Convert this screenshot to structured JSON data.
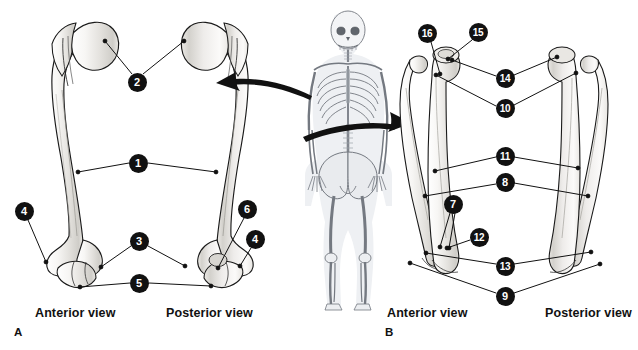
{
  "figure": {
    "background_color": "#ffffff",
    "callout_color": "#111111",
    "callout_text_color": "#ffffff",
    "leader_line_color": "#111111",
    "bone_fill": "#f2f1ef",
    "bone_outline": "#1a1a1a",
    "skeleton_tint": "#c9cdd4"
  },
  "panels": [
    {
      "id": "A",
      "letter": "A",
      "letter_pos": {
        "x": 14,
        "y": 326
      },
      "subject": "humerus",
      "views": [
        {
          "label": "Anterior view",
          "x": 35,
          "y": 306
        },
        {
          "label": "Posterior view",
          "x": 166,
          "y": 306
        }
      ]
    },
    {
      "id": "B",
      "letter": "B",
      "letter_pos": {
        "x": 385,
        "y": 326
      },
      "subject": "radius-and-ulna",
      "views": [
        {
          "label": "Anterior view",
          "x": 387,
          "y": 306
        },
        {
          "label": "Posterior view",
          "x": 545,
          "y": 306
        }
      ]
    }
  ],
  "callouts": [
    {
      "n": "1",
      "panel": "A",
      "cx": 138,
      "cy": 163,
      "leaders": [
        [
          129,
          163,
          78,
          172
        ],
        [
          148,
          163,
          216,
          172
        ]
      ]
    },
    {
      "n": "2",
      "panel": "A",
      "cx": 137,
      "cy": 82,
      "leaders": [
        [
          132,
          74,
          105,
          41
        ],
        [
          143,
          74,
          184,
          41
        ]
      ]
    },
    {
      "n": "3",
      "panel": "A",
      "cx": 139,
      "cy": 241,
      "leaders": [
        [
          131,
          246,
          101,
          267
        ],
        [
          148,
          246,
          185,
          266
        ]
      ]
    },
    {
      "n": "4",
      "panel": "A",
      "cx": 24,
      "cy": 211,
      "leaders": [
        [
          28,
          220,
          46,
          262
        ]
      ]
    },
    {
      "n": "5",
      "panel": "A",
      "cx": 139,
      "cy": 283,
      "leaders": [
        [
          130,
          283,
          80,
          287
        ],
        [
          149,
          283,
          211,
          286
        ]
      ]
    },
    {
      "n": "6",
      "panel": "A",
      "cx": 247,
      "cy": 209,
      "leaders": [
        [
          244,
          218,
          218,
          268
        ]
      ]
    },
    {
      "n": "4",
      "panel": "A",
      "cx": 255,
      "cy": 239,
      "leaders": [
        [
          251,
          248,
          240,
          266
        ]
      ]
    },
    {
      "n": "7",
      "panel": "B",
      "cx": 453,
      "cy": 204,
      "leaders": [
        [
          450,
          213,
          440,
          247
        ],
        [
          455,
          213,
          449,
          248
        ]
      ]
    },
    {
      "n": "8",
      "panel": "B",
      "cx": 505,
      "cy": 182,
      "leaders": [
        [
          496,
          184,
          425,
          196
        ],
        [
          514,
          183,
          588,
          196
        ]
      ]
    },
    {
      "n": "9",
      "panel": "B",
      "cx": 505,
      "cy": 296,
      "leaders": [
        [
          496,
          293,
          410,
          263
        ],
        [
          514,
          293,
          600,
          264
        ]
      ]
    },
    {
      "n": "10",
      "panel": "B",
      "cx": 505,
      "cy": 108,
      "leaders": [
        [
          496,
          106,
          436,
          75
        ],
        [
          514,
          105,
          576,
          73
        ]
      ]
    },
    {
      "n": "11",
      "panel": "B",
      "cx": 505,
      "cy": 156,
      "leaders": [
        [
          496,
          157,
          435,
          171
        ],
        [
          514,
          157,
          578,
          168
        ]
      ]
    },
    {
      "n": "12",
      "panel": "B",
      "cx": 479,
      "cy": 237,
      "leaders": [
        [
          470,
          240,
          447,
          248
        ]
      ]
    },
    {
      "n": "13",
      "panel": "B",
      "cx": 505,
      "cy": 266,
      "leaders": [
        [
          496,
          264,
          426,
          253
        ],
        [
          514,
          264,
          591,
          252
        ]
      ]
    },
    {
      "n": "14",
      "panel": "B",
      "cx": 505,
      "cy": 78,
      "leaders": [
        [
          496,
          76,
          452,
          60
        ],
        [
          514,
          75,
          557,
          57
        ]
      ]
    },
    {
      "n": "15",
      "panel": "B",
      "cx": 478,
      "cy": 32,
      "leaders": [
        [
          472,
          40,
          448,
          59
        ]
      ]
    },
    {
      "n": "16",
      "panel": "B",
      "cx": 427,
      "cy": 33,
      "leaders": [
        [
          431,
          42,
          440,
          74
        ]
      ]
    }
  ],
  "arrows": [
    {
      "name": "arrow-to-panel-a",
      "direction": "left",
      "from": [
        312,
        95
      ],
      "to": [
        216,
        83
      ]
    },
    {
      "name": "arrow-to-panel-b",
      "direction": "right",
      "from": [
        303,
        136
      ],
      "to": [
        412,
        122
      ]
    }
  ],
  "skeleton": {
    "name": "human-skeleton-reference",
    "x": 288,
    "y": 8,
    "width": 104,
    "height": 302
  }
}
